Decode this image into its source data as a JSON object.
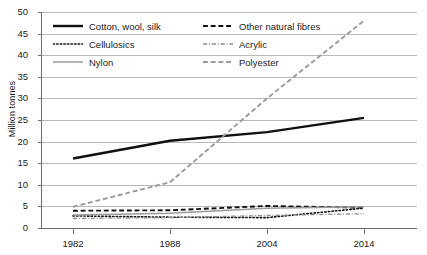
{
  "chart_data": {
    "type": "line",
    "title": "",
    "xlabel": "",
    "ylabel": "Million tonnes",
    "categories": [
      "1982",
      "1988",
      "2004",
      "2014"
    ],
    "ylim": [
      0,
      50
    ],
    "ytick_values": [
      0,
      5,
      10,
      15,
      20,
      25,
      30,
      35,
      40,
      45,
      50
    ],
    "ytick_labels": [
      "0",
      "5",
      "10",
      "15",
      "20",
      "25",
      "30",
      "35",
      "40",
      "45",
      "50"
    ],
    "grid": true,
    "legend_position": "top-left-inside",
    "series": [
      {
        "name": "Cotton, wool, silk",
        "values": [
          16.1,
          20.2,
          22.2,
          25.5
        ],
        "style": "solid",
        "color": "#101010",
        "width": 2.4
      },
      {
        "name": "Other natural fibres",
        "values": [
          4.0,
          4.1,
          5.1,
          4.7
        ],
        "style": "dashed",
        "color": "#101010",
        "width": 1.9
      },
      {
        "name": "Cellulosics",
        "values": [
          2.8,
          2.5,
          2.4,
          4.6
        ],
        "style": "dotted",
        "color": "#101010",
        "width": 1.6
      },
      {
        "name": "Acrylic",
        "values": [
          2.2,
          2.4,
          2.9,
          3.3
        ],
        "style": "dash-dot",
        "color": "#8e8e8e",
        "width": 1.3
      },
      {
        "name": "Nylon",
        "values": [
          3.0,
          3.4,
          4.6,
          4.9
        ],
        "style": "solid",
        "color": "#9a9a9a",
        "width": 1.5
      },
      {
        "name": "Polyester",
        "values": [
          4.9,
          10.6,
          30.0,
          48.0
        ],
        "style": "dashed",
        "color": "#9a9a9a",
        "width": 1.9
      }
    ],
    "legend_order": [
      "Cotton, wool, silk",
      "Other natural fibres",
      "Cellulosics",
      "Acrylic",
      "Nylon",
      "Polyester"
    ]
  },
  "axis": {
    "y_title": "Million tonnes"
  }
}
